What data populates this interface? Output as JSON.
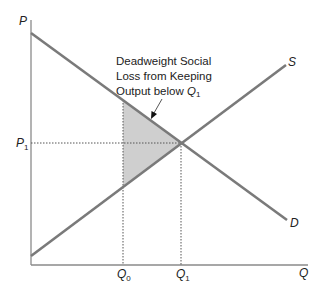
{
  "diagram": {
    "type": "supply-demand deadweight loss",
    "axes": {
      "y_label": "P",
      "x_label": "Q"
    },
    "curves": [
      {
        "name": "S",
        "label": "S",
        "description": "supply curve, upward sloping"
      },
      {
        "name": "D",
        "label": "D",
        "description": "demand curve, downward sloping"
      }
    ],
    "price_marks": [
      {
        "label": "P",
        "sub": "1"
      }
    ],
    "quantity_marks": [
      {
        "label": "Q",
        "sub": "0"
      },
      {
        "label": "Q",
        "sub": "1"
      }
    ],
    "annotation": {
      "line1": "Deadweight Social",
      "line2": "Loss from Keeping",
      "line3_prefix": "Output below ",
      "line3_var": "Q",
      "line3_sub": "1"
    },
    "colors": {
      "curve": "#7a7a7a",
      "axis": "#8a8a8a",
      "shade": "#cfcfcf",
      "dotted": "#555555",
      "text": "#222222"
    }
  }
}
